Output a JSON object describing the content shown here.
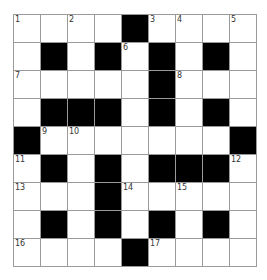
{
  "puzzle": {
    "rows": 9,
    "cols": 9,
    "colors": {
      "block": "#000000",
      "cell": "#ffffff",
      "border": "#9a9a9a"
    },
    "grid": [
      [
        "1",
        ".",
        "2",
        ".",
        "#",
        "3",
        "4",
        ".",
        "5"
      ],
      [
        ".",
        "#",
        ".",
        "#",
        "6",
        "#",
        ".",
        "#",
        "."
      ],
      [
        "7",
        ".",
        ".",
        ".",
        ".",
        "#",
        "8",
        ".",
        "."
      ],
      [
        ".",
        "#",
        "#",
        "#",
        ".",
        "#",
        ".",
        "#",
        "."
      ],
      [
        "#",
        "9",
        "10",
        ".",
        ".",
        ".",
        ".",
        ".",
        "#"
      ],
      [
        "11",
        "#",
        ".",
        "#",
        ".",
        "#",
        "#",
        "#",
        "12"
      ],
      [
        "13",
        ".",
        ".",
        "#",
        "14",
        ".",
        "15",
        ".",
        "."
      ],
      [
        ".",
        "#",
        ".",
        "#",
        ".",
        "#",
        ".",
        "#",
        "."
      ],
      [
        "16",
        ".",
        ".",
        ".",
        "#",
        "17",
        ".",
        ".",
        "."
      ]
    ]
  }
}
